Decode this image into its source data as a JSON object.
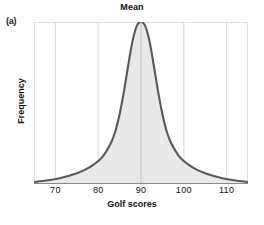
{
  "panel": {
    "label": "(a)"
  },
  "chart_data": {
    "type": "area",
    "title": "Mean",
    "xlabel": "Golf scores",
    "ylabel": "Frequency",
    "xlim": [
      65,
      115
    ],
    "ylim": [
      0,
      1
    ],
    "xticks": [
      70,
      80,
      90,
      100,
      110
    ],
    "xtick_labels": [
      "70",
      "80",
      "90",
      "100",
      "110"
    ],
    "yticks": [],
    "ytick_labels": [],
    "grid": true,
    "grid_axis": "x",
    "legend": null,
    "annotations": [
      {
        "name": "mean-line",
        "text": "Mean",
        "x": 90,
        "type": "vertical-line"
      }
    ],
    "series": [
      {
        "name": "Golf score distribution",
        "description": "Symmetric leptokurtic (peaked, heavy-tailed) frequency curve centered on the mean of 90",
        "x": [
          65,
          67,
          69,
          71,
          73,
          75,
          77,
          79,
          81,
          83,
          84,
          85,
          86,
          87,
          88,
          89,
          90,
          91,
          92,
          93,
          94,
          95,
          96,
          97,
          99,
          101,
          103,
          105,
          107,
          109,
          111,
          113,
          115
        ],
        "y": [
          0.012,
          0.018,
          0.026,
          0.036,
          0.049,
          0.066,
          0.089,
          0.121,
          0.168,
          0.255,
          0.325,
          0.43,
          0.57,
          0.73,
          0.88,
          0.975,
          1.0,
          0.975,
          0.88,
          0.73,
          0.57,
          0.43,
          0.325,
          0.255,
          0.168,
          0.121,
          0.089,
          0.066,
          0.049,
          0.036,
          0.026,
          0.018,
          0.012
        ]
      }
    ],
    "colors": {
      "curve": "#595959",
      "fill": "#e9e9e9",
      "grid": "#d8d8d8",
      "frame": "#e2e2e2",
      "axis": "#8a8a8a",
      "text": "#111111"
    }
  }
}
